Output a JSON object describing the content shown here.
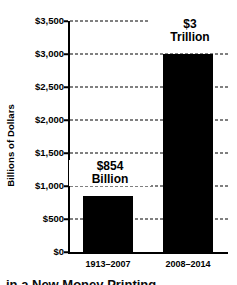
{
  "chart_data": {
    "type": "bar",
    "title": "",
    "xlabel": "",
    "ylabel": "Billions of Dollars",
    "categories": [
      "1913–2007",
      "2008–2014"
    ],
    "values": [
      854,
      3000
    ],
    "value_labels": [
      {
        "line1": "$854",
        "line2": "Billion"
      },
      {
        "line1": "$3",
        "line2": "Trillion"
      }
    ],
    "ylim": [
      0,
      3500
    ],
    "yticks": [
      0,
      500,
      1000,
      1500,
      2000,
      2500,
      3000,
      3500
    ],
    "ytick_labels": [
      "$0",
      "$500",
      "$1,000",
      "$1,500",
      "$2,000",
      "$2,500",
      "$3,000",
      "$3,500"
    ],
    "grid": true,
    "grid_style": "dashed",
    "legend": "none",
    "bar_color": "#000000",
    "background_color": "#ffffff"
  },
  "caption": {
    "text": "in a New Money Printing"
  }
}
